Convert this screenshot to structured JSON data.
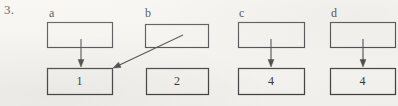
{
  "figure": {
    "item_number": "3.",
    "background_color": "#f6f4f0",
    "ink_color": "#3a3a3a",
    "columns": [
      {
        "id": "a",
        "label": "a",
        "label_x": 49,
        "label_y": 7,
        "top_box": {
          "x": 47,
          "y": 22,
          "w": 65,
          "h": 25,
          "value": ""
        },
        "bottom_box": {
          "x": 47,
          "y": 68,
          "w": 65,
          "h": 26,
          "value": "1"
        },
        "arrow": {
          "kind": "vertical",
          "x1": 81,
          "y1": 39,
          "x2": 81,
          "y2": 67
        }
      },
      {
        "id": "b",
        "label": "b",
        "label_x": 145,
        "label_y": 7,
        "top_box": {
          "x": 145,
          "y": 24,
          "w": 63,
          "h": 23,
          "value": ""
        },
        "bottom_box": {
          "x": 146,
          "y": 68,
          "w": 62,
          "h": 26,
          "value": "2"
        },
        "arrow": {
          "kind": "diagonal",
          "x1": 183,
          "y1": 35,
          "x2": 113,
          "y2": 68
        }
      },
      {
        "id": "c",
        "label": "c",
        "label_x": 239,
        "label_y": 7,
        "top_box": {
          "x": 238,
          "y": 22,
          "w": 66,
          "h": 25,
          "value": ""
        },
        "bottom_box": {
          "x": 238,
          "y": 68,
          "w": 66,
          "h": 26,
          "value": "4"
        },
        "arrow": {
          "kind": "vertical",
          "x1": 271,
          "y1": 39,
          "x2": 271,
          "y2": 67
        }
      },
      {
        "id": "d",
        "label": "d",
        "label_x": 331,
        "label_y": 7,
        "top_box": {
          "x": 330,
          "y": 22,
          "w": 65,
          "h": 25,
          "value": ""
        },
        "bottom_box": {
          "x": 330,
          "y": 68,
          "w": 65,
          "h": 26,
          "value": "4"
        },
        "arrow": {
          "kind": "vertical",
          "x1": 363,
          "y1": 39,
          "x2": 363,
          "y2": 67
        }
      }
    ]
  }
}
